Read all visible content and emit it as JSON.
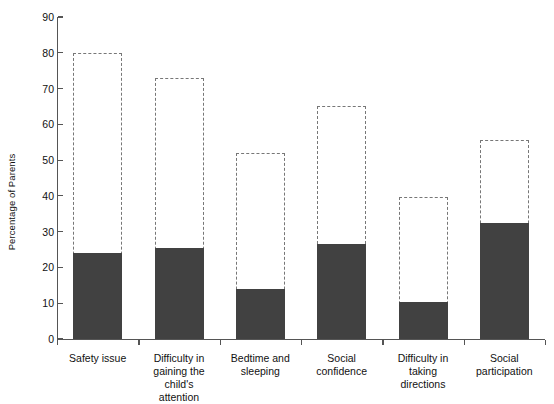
{
  "chart_data": {
    "type": "bar",
    "title": "",
    "xlabel": "",
    "ylabel": "Percentage of Parents",
    "ylim": [
      0,
      90
    ],
    "yticks": [
      0,
      10,
      20,
      30,
      40,
      50,
      60,
      70,
      80,
      90
    ],
    "grid": false,
    "legend": "none",
    "categories": [
      "Safety issue",
      "Difficulty in gaining the child's attention",
      "Bedtime and sleeping",
      "Social confidence",
      "Difficulty in taking directions",
      "Social participation"
    ],
    "category_lines": [
      [
        "Safety issue"
      ],
      [
        "Difficulty in",
        "gaining the",
        "child's",
        "attention"
      ],
      [
        "Bedtime and",
        "sleeping"
      ],
      [
        "Social",
        "confidence"
      ],
      [
        "Difficulty in",
        "taking",
        "directions"
      ],
      [
        "Social",
        "participation"
      ]
    ],
    "series": [
      {
        "name": "filled",
        "style": "solid-fill",
        "color": "#414141",
        "values": [
          24.0,
          25.3,
          14.0,
          26.5,
          10.3,
          32.5
        ]
      },
      {
        "name": "outline",
        "style": "dashed-outline",
        "color": "#777777",
        "values": [
          80.0,
          73.0,
          52.0,
          65.0,
          39.8,
          55.5
        ]
      }
    ]
  },
  "axis": {
    "y_title": "Percentage of Parents"
  }
}
